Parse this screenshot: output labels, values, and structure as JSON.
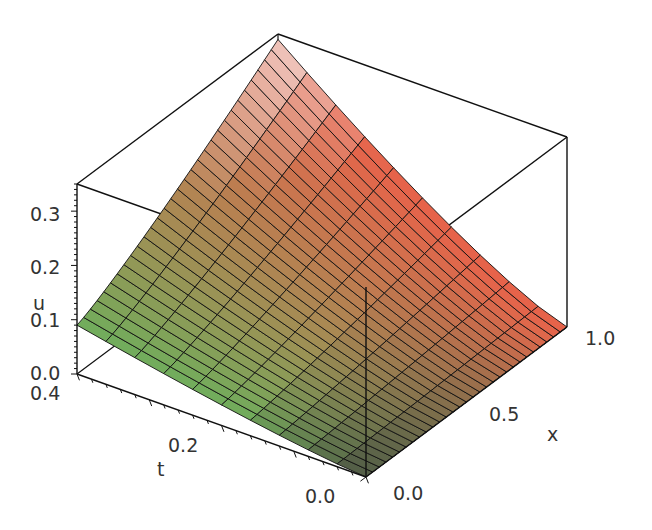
{
  "chart_data": {
    "type": "surface3d",
    "title": "",
    "function_label": "u(x,t)",
    "axes": {
      "x": {
        "label": "x",
        "range": [
          0.0,
          1.0
        ],
        "ticks": [
          "0.0",
          "0.5",
          "1.0"
        ]
      },
      "t": {
        "label": "t",
        "range": [
          0.0,
          0.4
        ],
        "ticks": [
          "0.0",
          "0.2",
          "0.4"
        ]
      },
      "u": {
        "label": "u",
        "range": [
          0.0,
          0.35
        ],
        "ticks": [
          "0.0",
          "0.1",
          "0.2",
          "0.3"
        ]
      }
    },
    "corner_values": [
      {
        "x": 0.0,
        "t": 0.0,
        "u": 0.0
      },
      {
        "x": 1.0,
        "t": 0.0,
        "u": 0.0
      },
      {
        "x": 0.0,
        "t": 0.4,
        "u": 0.09
      },
      {
        "x": 1.0,
        "t": 0.4,
        "u": 0.34
      }
    ],
    "grid": {
      "x_lines": 31,
      "t_lines": 11
    },
    "colors": {
      "low_x": "#6fae5c",
      "high_x": "#e8624a",
      "high_u": "#f2f2f0",
      "low_u": "#4a4440",
      "mesh": "#111111",
      "box": "#111111"
    }
  }
}
